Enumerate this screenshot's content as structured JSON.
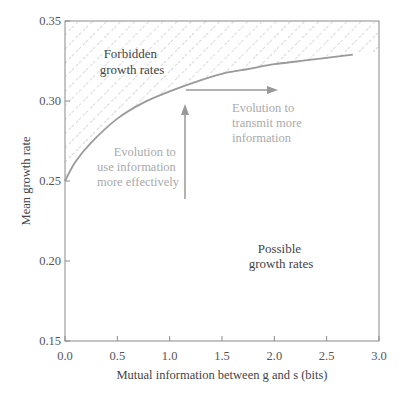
{
  "chart_data": {
    "type": "line",
    "title": "",
    "xlabel": "Mutual information between g and s (bits)",
    "ylabel": "Mean growth rate",
    "xlim": [
      0.0,
      3.0
    ],
    "ylim": [
      0.15,
      0.35
    ],
    "x_ticks": [
      "0.0",
      "0.5",
      "1.0",
      "1.5",
      "2.0",
      "2.5",
      "3.0"
    ],
    "y_ticks": [
      "0.15",
      "0.20",
      "0.25",
      "0.30",
      "0.35"
    ],
    "grid": false,
    "series": [
      {
        "name": "Maximum growth rate bound",
        "x": [
          0.0,
          0.1,
          0.25,
          0.5,
          0.75,
          1.0,
          1.25,
          1.5,
          1.75,
          2.0,
          2.25,
          2.5,
          2.75
        ],
        "y": [
          0.25,
          0.262,
          0.274,
          0.289,
          0.299,
          0.306,
          0.312,
          0.317,
          0.32,
          0.323,
          0.325,
          0.327,
          0.329
        ]
      }
    ],
    "regions": [
      {
        "label": "Forbidden growth rates",
        "fill": "hatched",
        "position": "above curve"
      },
      {
        "label": "Possible growth rates",
        "fill": "none",
        "position": "below curve"
      }
    ],
    "annotations": [
      {
        "text": "Forbidden growth rates",
        "lines": [
          "Forbidden",
          "growth rates"
        ]
      },
      {
        "text": "Possible growth rates",
        "lines": [
          "Possible",
          "growth rates"
        ]
      },
      {
        "text": "Evolution to use information more effectively",
        "lines": [
          "Evolution to",
          "use information",
          "more effectively"
        ],
        "arrow": "vertical up",
        "arrow_x": 1.15,
        "arrow_y": [
          0.239,
          0.297
        ]
      },
      {
        "text": "Evolution to transmit more information",
        "lines": [
          "Evolution to",
          "transmit more",
          "information"
        ],
        "arrow": "horizontal right",
        "arrow_y": 0.307,
        "arrow_x": [
          1.15,
          2.0
        ]
      }
    ],
    "colors": {
      "curve": "#999999",
      "axis": "#888888",
      "hatch": "#bbbbbb",
      "arrow": "#999999"
    }
  },
  "labels": {
    "xlabel": "Mutual information between g and s (bits)",
    "ylabel": "Mean growth rate",
    "forbidden_1": "Forbidden",
    "forbidden_2": "growth rates",
    "possible_1": "Possible",
    "possible_2": "growth rates",
    "use_1": "Evolution to",
    "use_2": "use information",
    "use_3": "more effectively",
    "transmit_1": "Evolution to",
    "transmit_2": "transmit more",
    "transmit_3": "information"
  }
}
